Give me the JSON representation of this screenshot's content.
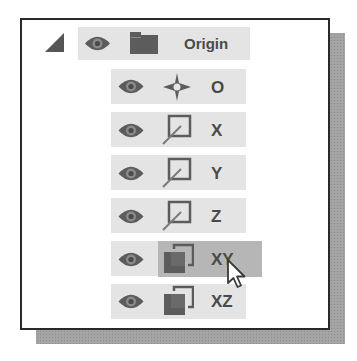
{
  "tree": {
    "root": {
      "label": "Origin",
      "expanded": true,
      "icons": [
        "collapse-triangle-icon",
        "eye-icon",
        "folder-icon"
      ]
    },
    "children": [
      {
        "label": "O",
        "type": "point",
        "icon": "origin-point-icon",
        "visible": true,
        "selected": false
      },
      {
        "label": "X",
        "type": "axis",
        "icon": "axis-icon",
        "visible": true,
        "selected": false
      },
      {
        "label": "Y",
        "type": "axis",
        "icon": "axis-icon",
        "visible": true,
        "selected": false
      },
      {
        "label": "Z",
        "type": "axis",
        "icon": "axis-icon",
        "visible": true,
        "selected": false
      },
      {
        "label": "XY",
        "type": "plane",
        "icon": "plane-icon",
        "visible": true,
        "selected": true
      },
      {
        "label": "XZ",
        "type": "plane",
        "icon": "plane-icon",
        "visible": true,
        "selected": false
      }
    ]
  },
  "colors": {
    "row_bg": "#e4e4e4",
    "selected_bg": "#b6b6b6",
    "icon": "#5c5c5c",
    "text": "#4a4a4a",
    "frame_border": "#2a2a2a",
    "shadow": "#a4a4a4"
  },
  "cursor": {
    "type": "arrow-pointer",
    "over": "XY"
  }
}
